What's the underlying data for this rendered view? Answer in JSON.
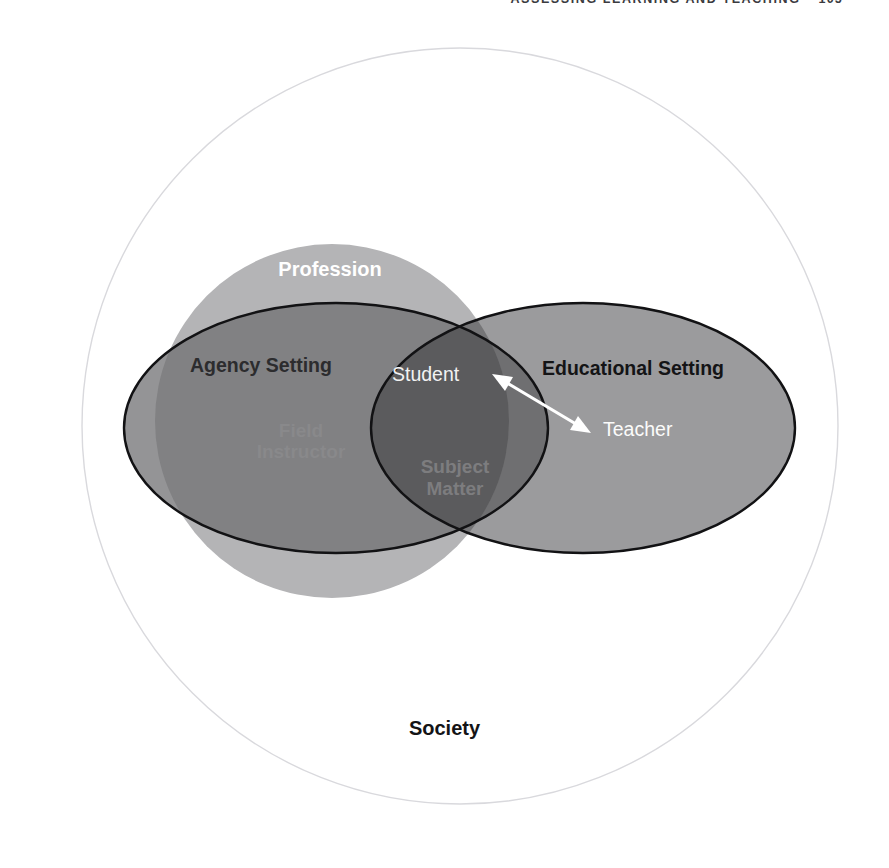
{
  "running_head": {
    "title": "ASSESSING LEARNING AND TEACHING",
    "page": "105"
  },
  "figure": {
    "outer_label": "Society",
    "regions": [
      {
        "id": "society",
        "label": "Society",
        "kind": "outer-circle",
        "fill": "#ffffff",
        "stroke": "#d8d8dc"
      },
      {
        "id": "profession",
        "label": "Profession",
        "kind": "circle",
        "fill": "#b3b3b5",
        "stroke": "none"
      },
      {
        "id": "agency-setting",
        "label": "Agency Setting",
        "kind": "ellipse-left",
        "fill": "#8f8f91",
        "stroke": "#141416"
      },
      {
        "id": "educational-setting",
        "label": "Educational Setting",
        "kind": "ellipse-right",
        "fill": "#9a9a9c",
        "stroke": "#141416"
      }
    ],
    "inner_labels": [
      {
        "id": "field-instructor",
        "line1": "Field",
        "line2": "Instructor"
      },
      {
        "id": "subject-matter",
        "line1": "Subject",
        "line2": "Matter"
      }
    ],
    "actors": {
      "student": "Student",
      "teacher": "Teacher"
    },
    "connector": {
      "id": "student-teacher-arrow",
      "style": "double-headed",
      "color": "#ffffff"
    },
    "colors": {
      "page_background": "#ffffff",
      "outer_circle_stroke": "#d8d8dc",
      "profession_fill": "#b3b3b5",
      "agency_fill": "#8f8f91",
      "educational_fill": "#9a9a9c",
      "overlap_agency_profession": "#7d7d7f",
      "overlap_core": "#5c5c5e",
      "outline": "#141416",
      "text_dark": "#141416",
      "text_light": "#ffffff",
      "text_faded": "#9a9a9c"
    }
  }
}
